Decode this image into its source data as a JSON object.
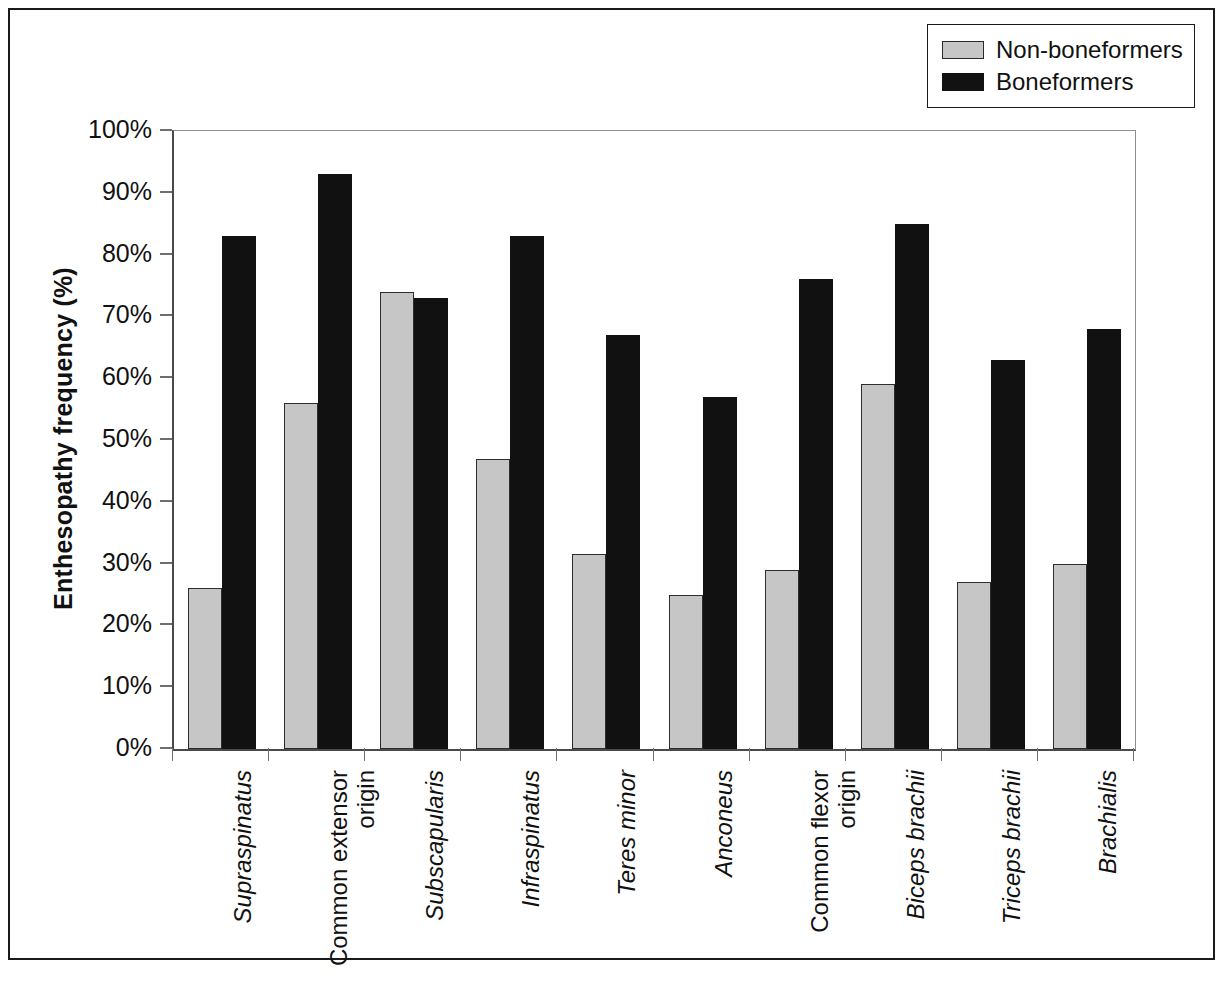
{
  "legend": {
    "entries": [
      {
        "label": "Non-boneformers",
        "color": "#c6c6c6",
        "swatch": "gray"
      },
      {
        "label": "Boneformers",
        "color": "#111111",
        "swatch": "black"
      }
    ]
  },
  "axes": {
    "y_title": "Enthesopathy frequency (%)",
    "y_ticks": [
      "100%",
      "90%",
      "80%",
      "70%",
      "60%",
      "50%",
      "40%",
      "30%",
      "20%",
      "10%",
      "0%"
    ]
  },
  "chart_data": {
    "type": "bar",
    "title": "",
    "xlabel": "",
    "ylabel": "Enthesopathy frequency (%)",
    "ylim": [
      0,
      100
    ],
    "ytick_values": [
      0,
      10,
      20,
      30,
      40,
      50,
      60,
      70,
      80,
      90,
      100
    ],
    "grid": false,
    "legend_position": "top-right",
    "units": "percent",
    "categories": [
      "Supraspinatus",
      "Common extensor origin",
      "Subscapularis",
      "Infraspinatus",
      "Teres minor",
      "Anconeus",
      "Common flexor origin",
      "Biceps brachii",
      "Triceps brachii",
      "Brachialis"
    ],
    "category_labels_display": [
      "Supraspinatus",
      "Common extensor\norigin",
      "Subscapularis",
      "Infraspinatus",
      "Teres minor",
      "Anconeus",
      "Common flexor\norigin",
      "Biceps brachii",
      "Triceps brachii",
      "Brachialis"
    ],
    "category_label_italic": [
      true,
      false,
      true,
      true,
      true,
      true,
      false,
      true,
      true,
      true
    ],
    "series": [
      {
        "name": "Non-boneformers",
        "color": "#c6c6c6",
        "values": [
          26,
          56,
          74,
          47,
          31.5,
          25,
          29,
          59,
          27,
          30
        ]
      },
      {
        "name": "Boneformers",
        "color": "#111111",
        "values": [
          83,
          93,
          73,
          83,
          67,
          57,
          76,
          85,
          63,
          68
        ]
      }
    ]
  }
}
